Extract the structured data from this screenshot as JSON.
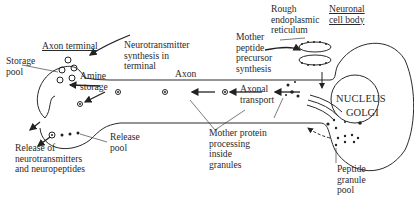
{
  "diagram": {
    "type": "neuron-schematic",
    "regions": {
      "axon_terminal": "Axon terminal",
      "cell_body": "Neuronal\ncell body",
      "axon": "Axon",
      "nucleus": "NUCLEUS",
      "golgi": "GOLGI"
    },
    "labels": {
      "storage_pool": "Storage\npool",
      "amine_storage": "Amine\nstorage",
      "nt_synthesis": "Neurotransmitter\nsynthesis in\nterminal",
      "release_pool": "Release\npool",
      "release_of": "Release of\nneurotransmitters\nand neuropeptides",
      "rer": "Rough\nendoplasmic\nreticulum",
      "mother_peptide": "Mother\npeptide\nprecursor\nsynthesis",
      "axonal_transport": "Axonal\ntransport",
      "mother_protein": "Mother protein\nprocessing\ninside\ngranules",
      "peptide_granule": "Peptide\ngranule\npool"
    },
    "colors": {
      "ink": "#2a2a2a",
      "background": "#ffffff"
    }
  }
}
